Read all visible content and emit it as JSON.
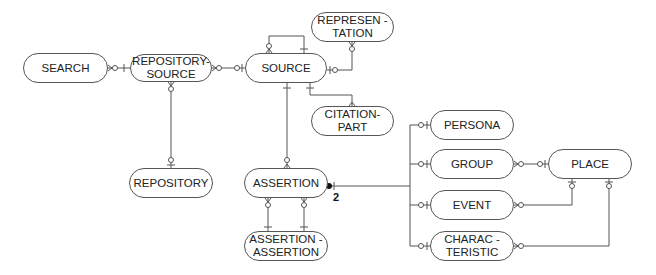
{
  "diagram": {
    "type": "entity-relationship",
    "entities": [
      {
        "id": "search",
        "label": "SEARCH"
      },
      {
        "id": "repository_source",
        "label": "REPOSITORY-\nSOURCE"
      },
      {
        "id": "source",
        "label": "SOURCE"
      },
      {
        "id": "representation",
        "label": "REPRESEN -\nTATION"
      },
      {
        "id": "citation_part",
        "label": "CITATION-\nPART"
      },
      {
        "id": "repository",
        "label": "REPOSITORY"
      },
      {
        "id": "assertion",
        "label": "ASSERTION"
      },
      {
        "id": "assertion_assertion",
        "label": "ASSERTION -\nASSERTION"
      },
      {
        "id": "persona",
        "label": "PERSONA"
      },
      {
        "id": "group",
        "label": "GROUP"
      },
      {
        "id": "place",
        "label": "PLACE"
      },
      {
        "id": "event",
        "label": "EVENT"
      },
      {
        "id": "characteristic",
        "label": "CHARAC -\nTERISTIC"
      }
    ],
    "relationships": [
      {
        "from": "search",
        "to": "repository_source"
      },
      {
        "from": "repository_source",
        "to": "source"
      },
      {
        "from": "repository_source",
        "to": "repository"
      },
      {
        "from": "source",
        "to": "source",
        "note": "self"
      },
      {
        "from": "source",
        "to": "representation"
      },
      {
        "from": "source",
        "to": "citation_part"
      },
      {
        "from": "source",
        "to": "assertion"
      },
      {
        "from": "assertion",
        "to": "assertion_assertion",
        "count": 2
      },
      {
        "from": "assertion",
        "to": "persona|group|event|characteristic",
        "arc": true
      },
      {
        "from": "group",
        "to": "place"
      },
      {
        "from": "event",
        "to": "place"
      },
      {
        "from": "characteristic",
        "to": "place"
      }
    ],
    "arc_cardinality": "2",
    "line_color": "#555555"
  }
}
